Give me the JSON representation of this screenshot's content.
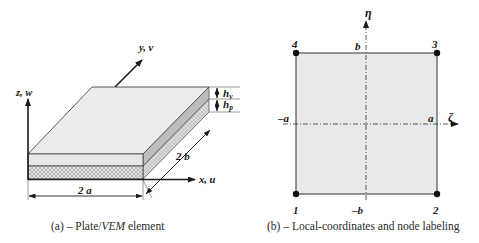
{
  "figure_a": {
    "caption_prefix": "(a) – Plate/",
    "caption_italic": "VEM",
    "caption_suffix": " element",
    "axes": {
      "z": "z, w",
      "y": "y, v",
      "x": "x, u"
    },
    "dimensions": {
      "width": "2 a",
      "depth": "2 b"
    },
    "thickness_labels": {
      "viscoelastic": "h",
      "viscoelastic_sub": "v",
      "plate": "h",
      "plate_sub": "p"
    },
    "colors": {
      "top_face": "#ececec",
      "vem_layer": "#e4e4e4",
      "plate_layer_hatch": "#c8c8c8",
      "side_face": "#bdbdbd",
      "stroke": "#333333"
    }
  },
  "figure_b": {
    "caption": "(b) – Local-coordinates and node labeling",
    "axes": {
      "horizontal": "ζ",
      "vertical": "η"
    },
    "bounds": {
      "left": "–a",
      "right": "a",
      "top": "b",
      "bottom": "–b"
    },
    "nodes": [
      {
        "id": "1",
        "position": "bottom-left"
      },
      {
        "id": "2",
        "position": "bottom-right"
      },
      {
        "id": "3",
        "position": "top-right"
      },
      {
        "id": "4",
        "position": "top-left"
      }
    ],
    "colors": {
      "element_fill": "#e9e9e9",
      "stroke": "#444444"
    }
  }
}
